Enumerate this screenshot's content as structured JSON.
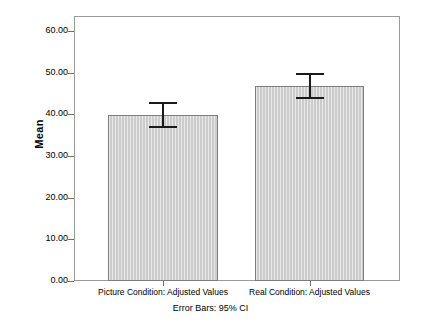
{
  "chart_data": {
    "type": "bar",
    "title": "",
    "subtitle": "",
    "xlabel": "",
    "ylabel": "Mean",
    "ylim": [
      0,
      60
    ],
    "grid": false,
    "legend": "none",
    "categories": [
      "Picture Condition: Adjusted Values",
      "Real Condition: Adjusted Values"
    ],
    "values": [
      39.9,
      46.7
    ],
    "error_bars": {
      "type": "95% CI",
      "lower": [
        36.8,
        43.6
      ],
      "upper": [
        43.0,
        49.9
      ]
    },
    "ytick_labels": [
      "60.00",
      "50.00",
      "40.00",
      "30.00",
      "20.00",
      "10.00",
      "0.00"
    ],
    "ytick_values": [
      60,
      50,
      40,
      30,
      20,
      10,
      0
    ],
    "annotation": "Error Bars: 95% CI",
    "bar_fill_color": "#cccccc",
    "bar_border_color": "#7d7d7d",
    "error_bar_color": "#1a1a1a",
    "frame_color": "#9a9a9a",
    "background_color": "#ffffff"
  },
  "axis": {
    "y_title": "Mean"
  },
  "footer": {
    "note": "Error Bars: 95% CI"
  }
}
